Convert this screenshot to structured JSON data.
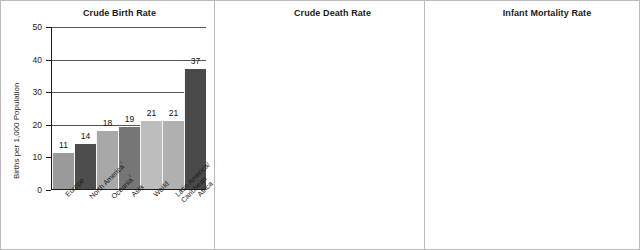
{
  "chart_data": [
    {
      "type": "bar",
      "title": "Crude Birth Rate",
      "xlabel": "",
      "ylabel": "Births per 1,000 Population",
      "ylim": [
        0,
        50
      ],
      "yticks": [
        0,
        10,
        20,
        30,
        40,
        50
      ],
      "grid": true,
      "legend": "none",
      "categories": [
        "Europe",
        "North America¹",
        "Oceania²",
        "Asia",
        "World",
        "Latin America/Caribbean",
        "Africa"
      ],
      "category_lines": [
        [
          "Europe"
        ],
        [
          "North America",
          "¹"
        ],
        [
          "Oceania",
          "²"
        ],
        [
          "Asia"
        ],
        [
          "World"
        ],
        [
          "Latin America/",
          "Caribbean"
        ],
        [
          "Africa"
        ]
      ],
      "values": [
        11,
        14,
        18,
        19,
        21,
        21,
        37
      ],
      "bar_colors": [
        "#9a9a9a",
        "#4d4d4d",
        "#a8a8a8",
        "#767676",
        "#bdbdbd",
        "#b0b0b0",
        "#4a4a4a"
      ]
    },
    {
      "type": "bar",
      "title": "Crude Death Rate",
      "xlabel": "",
      "ylabel": "Deaths per 1,000 Population",
      "ylim": [
        0,
        25
      ],
      "yticks": [
        0,
        5,
        10,
        15,
        20,
        25
      ],
      "grid": true,
      "legend": "none",
      "categories": [
        "Latin America/Caribbean",
        "Oceania²",
        "Asia",
        "North America¹",
        "World",
        "Europe",
        "Africa"
      ],
      "category_lines": [
        [
          "Latin America/",
          "Caribbean"
        ],
        [
          "Oceania",
          "²"
        ],
        [
          "Asia"
        ],
        [
          "North America",
          "¹"
        ],
        [
          "World"
        ],
        [
          "Europe"
        ],
        [
          "Africa"
        ]
      ],
      "values": [
        6,
        7,
        7,
        8,
        8,
        11,
        14
      ],
      "bar_colors": [
        "#a5a5a5",
        "#b0b0b0",
        "#6f6f6f",
        "#454545",
        "#bdbdbd",
        "#8f8f8f",
        "#3f3f3f"
      ]
    },
    {
      "type": "bar",
      "title": "Infant Mortality Rate",
      "xlabel": "",
      "ylabel": "Infant Deaths (in first year) per 1,000 Live Births",
      "ylim": [
        0,
        100
      ],
      "yticks": [
        0,
        10,
        20,
        30,
        40,
        50,
        60,
        70,
        80,
        90,
        100
      ],
      "grid": true,
      "legend": "none",
      "categories": [
        "Europe",
        "North America¹",
        "Latin America/Caribbean",
        "Oceania²",
        "Asia",
        "World",
        "Africa"
      ],
      "category_lines": [
        [
          "Europe"
        ],
        [
          "North America",
          "¹"
        ],
        [
          "Latin America/",
          "Caribbean"
        ],
        [
          "Oceania",
          "²"
        ],
        [
          "Asia"
        ],
        [
          "World"
        ],
        [
          "Africa"
        ]
      ],
      "values": [
        6,
        7,
        23,
        25,
        45,
        49,
        82
      ],
      "bar_colors": [
        "#4a4a4a",
        "#9a9a9a",
        "#b3b3b3",
        "#8a8a8a",
        "#6a6a6a",
        "#b8b8b8",
        "#3f3f3f"
      ]
    }
  ]
}
